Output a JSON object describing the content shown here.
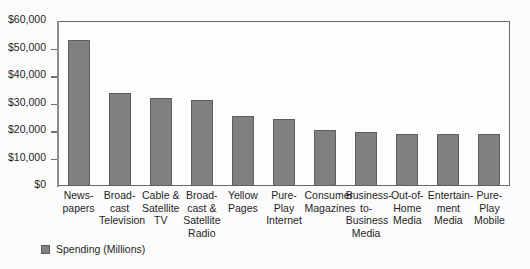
{
  "chart_data": {
    "type": "bar",
    "title": "",
    "subtitle": "",
    "xlabel": "",
    "ylabel": "",
    "ylim": [
      0,
      60000
    ],
    "ytick_values": [
      0,
      10000,
      20000,
      30000,
      40000,
      50000,
      60000
    ],
    "ytick_labels": [
      "$0",
      "$10,000",
      "$20,000",
      "$30,000",
      "$40,000",
      "$50,000",
      "$60,000"
    ],
    "grid": false,
    "legend_position": "bottom-left",
    "categories": [
      "News-\npapers",
      "Broad-\ncast\nTelevision",
      "Cable &\nSatellite\nTV",
      "Broad-\ncast &\nSatellite\nRadio",
      "Yellow\nPages",
      "Pure-\nPlay\nInternet",
      "Consumer\nMagazines",
      "Business-\nto-\nBusiness\nMedia",
      "Out-of-\nHome\nMedia",
      "Entertain-\nment\nMedia",
      "Pure-\nPlay\nMobile"
    ],
    "category_lines": [
      [
        "News-",
        "papers"
      ],
      [
        "Broad-",
        "cast",
        "Television"
      ],
      [
        "Cable &",
        "Satellite",
        "TV"
      ],
      [
        "Broad-",
        "cast &",
        "Satellite",
        "Radio"
      ],
      [
        "Yellow",
        "Pages"
      ],
      [
        "Pure-",
        "Play",
        "Internet"
      ],
      [
        "Consumer",
        "Magazines"
      ],
      [
        "Business-",
        "to-",
        "Business",
        "Media"
      ],
      [
        "Out-of-",
        "Home",
        "Media"
      ],
      [
        "Entertain-",
        "ment",
        "Media"
      ],
      [
        "Pure-",
        "Play",
        "Mobile"
      ]
    ],
    "series": [
      {
        "name": "Spending (Millions)",
        "color": "#808080",
        "values": [
          53000,
          33800,
          32000,
          31200,
          25500,
          24400,
          20300,
          19600,
          19000,
          18900,
          18800
        ]
      }
    ]
  },
  "legend": {
    "entries": [
      {
        "label": "Spending (Millions)",
        "color": "#808080"
      }
    ]
  }
}
